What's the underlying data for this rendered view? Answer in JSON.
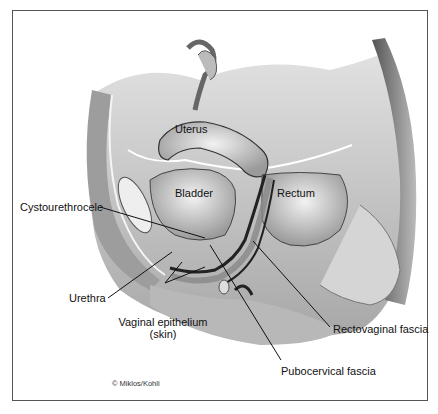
{
  "figure": {
    "labels": {
      "uterus": "Uterus",
      "bladder": "Bladder",
      "rectum": "Rectum",
      "cystourethrocele": "Cystourethrocele",
      "urethra": "Urethra",
      "vaginal_epithelium_line1": "Vaginal epithelium",
      "vaginal_epithelium_line2": "(skin)",
      "rectovaginal_fascia": "Rectovaginal fascia",
      "pubocervical_fascia": "Pubocervical fascia"
    },
    "credit": "© Miklos/Kohli"
  }
}
